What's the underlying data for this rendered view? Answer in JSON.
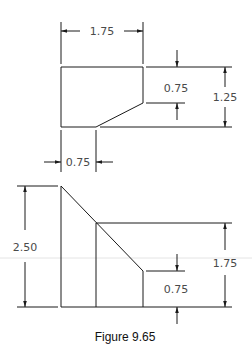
{
  "figure": {
    "caption": "Figure 9.65",
    "line_color": "#1a1a1a",
    "top_view": {
      "dimensions": {
        "width_top": "1.75",
        "chamfer_height": "0.75",
        "height": "1.25",
        "chamfer_width": "0.75"
      }
    },
    "front_view": {
      "dimensions": {
        "overall_height": "2.50",
        "step_height": "1.75",
        "low_height": "0.75"
      }
    }
  }
}
